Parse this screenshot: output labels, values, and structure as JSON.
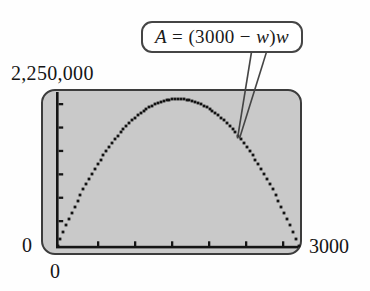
{
  "callout": {
    "text": "A = (3000 − w)w",
    "parts": {
      "a": "A",
      "mid": " = (3000 − ",
      "w1": "w",
      "close": ")",
      "w2": "w"
    }
  },
  "chart_data": {
    "type": "line",
    "title": "",
    "equation": "A = (3000 − w)w",
    "x_variable": "w",
    "y_variable": "A",
    "x_range": [
      0,
      3000
    ],
    "y_range": [
      0,
      2250000
    ],
    "coefficients": {
      "a": -1,
      "b": 3000,
      "c": 0
    },
    "vertex": {
      "w": 1500,
      "A": 2250000
    },
    "x_tick_count": 6,
    "y_tick_count": 6,
    "grid": false,
    "legend": false,
    "axis_labels": {
      "y_max": "2,250,000",
      "y_min": "0",
      "x_min": "0",
      "x_max": "3000"
    },
    "series": [
      {
        "name": "A = (3000 − w)w",
        "x": [
          0,
          250,
          500,
          750,
          1000,
          1250,
          1500,
          1750,
          2000,
          2250,
          2500,
          2750,
          3000
        ],
        "y": [
          0,
          687500,
          1250000,
          1687500,
          2000000,
          2187500,
          2250000,
          2187500,
          2000000,
          1687500,
          1250000,
          687500,
          0
        ]
      }
    ],
    "colors": {
      "curve": "#141414",
      "screen_fill": "#c9c9c9",
      "screen_border": "#3c3c3c",
      "callout_border": "#454545"
    }
  }
}
